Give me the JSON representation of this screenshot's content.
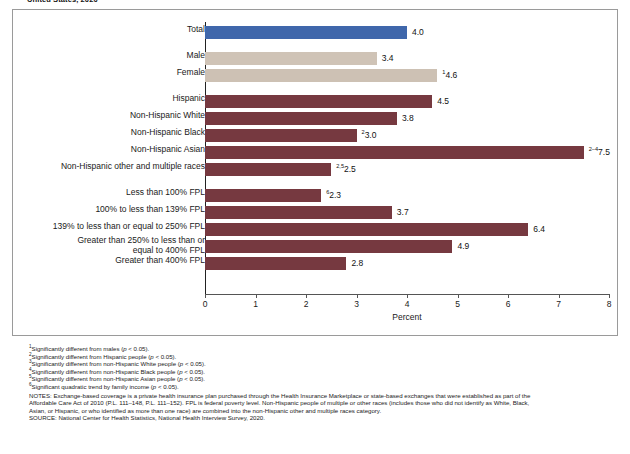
{
  "figure": {
    "title": "United States, 2020"
  },
  "axis": {
    "x_title": "Percent",
    "x_ticks": [
      "0",
      "1",
      "2",
      "3",
      "4",
      "5",
      "6",
      "7",
      "8"
    ]
  },
  "chart_data": {
    "type": "bar",
    "orientation": "horizontal",
    "title": "United States, 2020",
    "xlabel": "Percent",
    "ylabel": "",
    "xlim": [
      0,
      8
    ],
    "grid": false,
    "legend": "none",
    "categories": [
      "Total",
      "Male",
      "Female",
      "Hispanic",
      "Non-Hispanic White",
      "Non-Hispanic Black",
      "Non-Hispanic Asian",
      "Non-Hispanic other and multiple races",
      "Less than 100% FPL",
      "100% to less than 139% FPL",
      "139% to less than or equal to 250% FPL",
      "Greater than 250% to less than or\nequal to 400% FPL",
      "Greater than 400% FPL"
    ],
    "values": [
      4.0,
      3.4,
      4.6,
      4.5,
      3.8,
      3.0,
      7.5,
      2.5,
      2.3,
      3.7,
      6.4,
      4.9,
      2.8
    ],
    "value_labels": [
      "4.0",
      "3.4",
      "4.6",
      "4.5",
      "3.8",
      "3.0",
      "7.5",
      "2.5",
      "2.3",
      "3.7",
      "6.4",
      "4.9",
      "2.8"
    ],
    "value_footnote_marks": [
      "",
      "",
      "1",
      "",
      "",
      "2",
      "2–4",
      "2,5",
      "6",
      "",
      "",
      "",
      ""
    ],
    "bar_colors": [
      "#3f67ab",
      "#cfc3b6",
      "#cdc1b4",
      "#763940",
      "#763940",
      "#763940",
      "#763940",
      "#763940",
      "#763940",
      "#763940",
      "#763940",
      "#763940",
      "#763940"
    ],
    "group_gaps_after": [
      0,
      2,
      7
    ],
    "colors": {
      "total": "#3f67ab",
      "sex": "#cfc3b6",
      "race_and_income": "#763940",
      "axis": "#555555",
      "frame": "#9a9a9a"
    }
  },
  "footnotes": [
    {
      "mark": "1",
      "text": "Significantly different from males (",
      "italic": "p",
      "tail": " < 0.05)."
    },
    {
      "mark": "2",
      "text": "Significantly different from Hispanic people (",
      "italic": "p",
      "tail": " < 0.05)."
    },
    {
      "mark": "3",
      "text": "Significantly different from non-Hispanic White people (",
      "italic": "p",
      "tail": " < 0.05)."
    },
    {
      "mark": "4",
      "text": "Significantly different from non-Hispanic Black people (",
      "italic": "p",
      "tail": " < 0.05)."
    },
    {
      "mark": "5",
      "text": "Significantly different from non-Hispanic Asian people (",
      "italic": "p",
      "tail": " < 0.05)."
    },
    {
      "mark": "6",
      "text": "Significant quadratic trend by family income (",
      "italic": "p",
      "tail": " < 0.05)."
    }
  ],
  "notes": {
    "line1": "NOTES: Exchange-based coverage is a private health insurance plan purchased through the Health Insurance Marketplace or state-based exchanges that were established as part of the",
    "line2": "Affordable Care Act of 2010 (P.L. 111–148, P.L. 111–152). FPL is federal poverty level. Non-Hispanic people of multiple or other races (includes those who did not identify as White, Black,",
    "line3": "Asian, or Hispanic, or who identified as more than one race) are combined into the non-Hispanic other and multiple races category."
  },
  "source": "SOURCE: National Center for Health Statistics, National Health Interview Survey, 2020."
}
